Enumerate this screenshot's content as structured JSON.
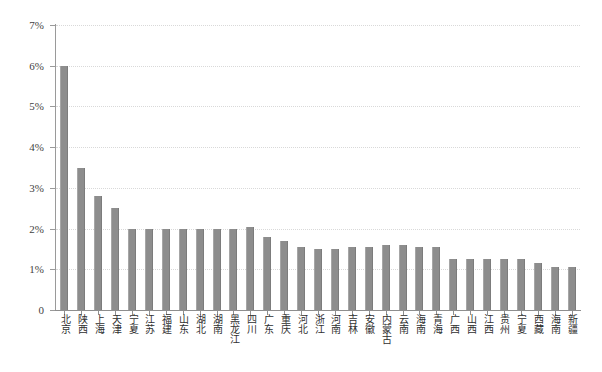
{
  "chart_data": {
    "type": "bar",
    "title": "",
    "subtitle": "",
    "xlabel": "",
    "ylabel": "",
    "ylim": [
      0,
      0.07
    ],
    "grid": "horizontal-dotted",
    "legend": "none",
    "orientation": "vertical",
    "bar_color": "#8d8d8d",
    "y_ticks": [
      0,
      0.01,
      0.02,
      0.03,
      0.04,
      0.05,
      0.06,
      0.07
    ],
    "y_tick_labels": [
      "0",
      "1%",
      "2%",
      "3%",
      "4%",
      "5%",
      "6%",
      "7%"
    ],
    "categories": [
      "北京",
      "陕西",
      "上海",
      "天津",
      "宁夏",
      "江苏",
      "福建",
      "山东",
      "湖北",
      "湖南",
      "黑龙江",
      "四川",
      "广东",
      "重庆",
      "河北",
      "浙江",
      "河南",
      "吉林",
      "安徽",
      "内蒙古",
      "云南",
      "海南",
      "青海",
      "广西",
      "山西",
      "江西",
      "贵州",
      "宁夏",
      "西藏",
      "海南",
      "新疆"
    ],
    "values": [
      6.0,
      3.5,
      2.8,
      2.5,
      2.0,
      2.0,
      2.0,
      2.0,
      2.0,
      2.0,
      2.0,
      2.05,
      1.8,
      1.7,
      1.55,
      1.5,
      1.5,
      1.55,
      1.55,
      1.6,
      1.6,
      1.55,
      1.55,
      1.25,
      1.25,
      1.25,
      1.25,
      1.25,
      1.15,
      1.05,
      1.05
    ],
    "value_unit": "%",
    "value_labels": [
      "6.0%",
      "3.5%",
      "2.8%",
      "2.5%",
      "2.0%",
      "2.0%",
      "2.0%",
      "2.0%",
      "2.0%",
      "2.0%",
      "2.0%",
      "2.05%",
      "1.8%",
      "1.7%",
      "1.55%",
      "1.5%",
      "1.5%",
      "1.55%",
      "1.55%",
      "1.6%",
      "1.6%",
      "1.55%",
      "1.55%",
      "1.25%",
      "1.25%",
      "1.25%",
      "1.25%",
      "1.25%",
      "1.15%",
      "1.05%",
      "1.05%"
    ]
  }
}
